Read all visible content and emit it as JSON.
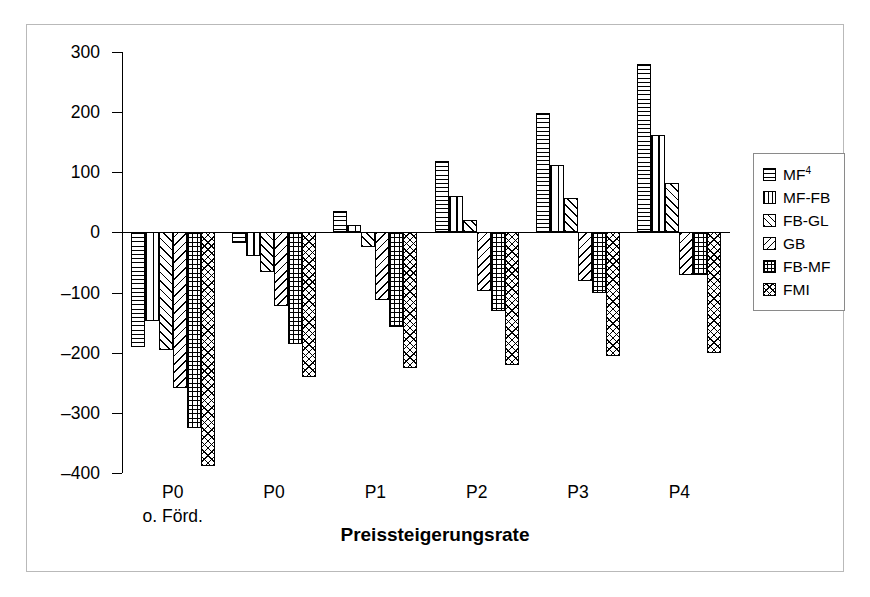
{
  "chart_data": {
    "type": "bar",
    "title": "",
    "xlabel": "Preissteigerungsrate",
    "ylabel": "[€/ha LF]",
    "ylim": [
      -400,
      300
    ],
    "yticks": [
      300,
      200,
      100,
      0,
      -100,
      -200,
      -300,
      -400
    ],
    "ytick_labels": [
      "300",
      "200",
      "100",
      "0",
      "-100",
      "-200",
      "-300",
      "-400"
    ],
    "grid": false,
    "legend_position": "right",
    "categories": [
      "P0",
      "P0",
      "P1",
      "P2",
      "P3",
      "P4"
    ],
    "category_sublabels": [
      "o. Förd.",
      "",
      "",
      "",
      "",
      ""
    ],
    "series": [
      {
        "name": "MF⁴",
        "pattern": "horizontal-lines",
        "values": [
          -190,
          -18,
          35,
          118,
          198,
          280
        ]
      },
      {
        "name": "MF-FB",
        "pattern": "vertical-lines",
        "values": [
          -148,
          -40,
          12,
          60,
          112,
          162
        ]
      },
      {
        "name": "FB-GL",
        "pattern": "forward-diagonal",
        "values": [
          -195,
          -65,
          -25,
          20,
          58,
          82
        ]
      },
      {
        "name": "GB",
        "pattern": "backward-diagonal",
        "values": [
          -258,
          -122,
          -112,
          -98,
          -80,
          -70
        ]
      },
      {
        "name": "FB-MF",
        "pattern": "grid",
        "values": [
          -325,
          -185,
          -158,
          -130,
          -100,
          -70
        ]
      },
      {
        "name": "FMI",
        "pattern": "diagonal-cross",
        "values": [
          -388,
          -240,
          -225,
          -220,
          -205,
          -200
        ]
      }
    ]
  },
  "legend": {
    "items": [
      {
        "label": "MF",
        "superscript": "4"
      },
      {
        "label": "MF-FB",
        "superscript": ""
      },
      {
        "label": "FB-GL",
        "superscript": ""
      },
      {
        "label": "GB",
        "superscript": ""
      },
      {
        "label": "FB-MF",
        "superscript": ""
      },
      {
        "label": "FMI",
        "superscript": ""
      }
    ]
  },
  "colors": {
    "foreground": "#000000",
    "background": "#ffffff",
    "frame": "#b9b9b9",
    "legend_border": "#8a8a8a"
  }
}
